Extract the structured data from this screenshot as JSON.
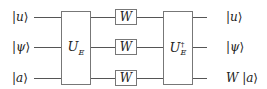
{
  "diagram": {
    "type": "quantum-circuit",
    "inputs": [
      {
        "label_open": "|",
        "label_sym": "u",
        "label_close": "⟩"
      },
      {
        "label_open": "|",
        "label_sym": "ψ",
        "label_close": "⟩"
      },
      {
        "label_open": "|",
        "label_sym": "a",
        "label_close": "⟩"
      }
    ],
    "gates": {
      "ue": {
        "base": "U",
        "sub": "E",
        "sup": ""
      },
      "w": [
        "W",
        "W",
        "W"
      ],
      "ue_dag": {
        "base": "U",
        "sub": "E",
        "sup": "†"
      }
    },
    "outputs": [
      {
        "prefix": "",
        "label_open": "|",
        "label_sym": "u",
        "label_close": "⟩"
      },
      {
        "prefix": "",
        "label_open": "|",
        "label_sym": "ψ",
        "label_close": "⟩"
      },
      {
        "prefix": "W ",
        "label_open": "|",
        "label_sym": "a",
        "label_close": "⟩"
      }
    ]
  }
}
